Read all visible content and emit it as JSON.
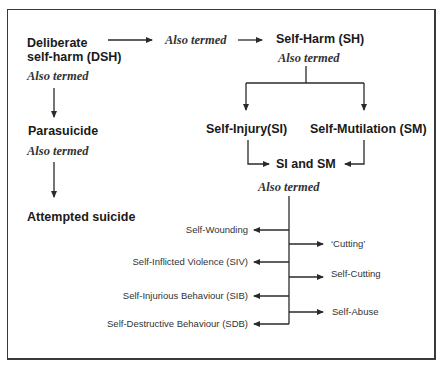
{
  "diagram": {
    "title": "",
    "nodes": {
      "dsh": {
        "line1": "Deliberate",
        "line2": "self-harm (DSH)"
      },
      "dsh_also": "Also termed",
      "mid_also": "Also termed",
      "sh": "Self-Harm (SH)",
      "sh_also": "Also termed",
      "parasuicide": "Parasuicide",
      "parasuicide_also": "Also termed",
      "attempted": "Attempted suicide",
      "si": "Self-Injury(SI)",
      "sm": "Self-Mutilation (SM)",
      "si_sm": "SI and SM",
      "si_sm_also": "Also termed"
    },
    "left_terms": [
      "Self-Wounding",
      "Self-Inflicted Violence (SIV)",
      "Self-Injurious Behaviour (SIB)",
      "Self-Destructive Behaviour (SDB)"
    ],
    "right_terms": [
      "‘Cutting’",
      "Self-Cutting",
      "Self-Abuse"
    ],
    "edges": [
      [
        "Deliberate self-harm (DSH)",
        "Also termed"
      ],
      [
        "Also termed",
        "Self-Harm (SH)"
      ],
      [
        "Deliberate self-harm (DSH)",
        "Parasuicide"
      ],
      [
        "Parasuicide",
        "Attempted suicide"
      ],
      [
        "Self-Harm (SH)",
        "Self-Injury(SI)"
      ],
      [
        "Self-Harm (SH)",
        "Self-Mutilation (SM)"
      ],
      [
        "Self-Injury(SI)",
        "SI and SM"
      ],
      [
        "Self-Mutilation (SM)",
        "SI and SM"
      ],
      [
        "SI and SM",
        "Self-Wounding"
      ],
      [
        "SI and SM",
        "Self-Inflicted Violence (SIV)"
      ],
      [
        "SI and SM",
        "Self-Injurious Behaviour (SIB)"
      ],
      [
        "SI and SM",
        "Self-Destructive Behaviour (SDB)"
      ],
      [
        "SI and SM",
        "‘Cutting’"
      ],
      [
        "SI and SM",
        "Self-Cutting"
      ],
      [
        "SI and SM",
        "Self-Abuse"
      ]
    ]
  },
  "colors": {
    "line": "#2a2a2a",
    "text": "#1a1a1a",
    "border": "#3a3a3a"
  }
}
